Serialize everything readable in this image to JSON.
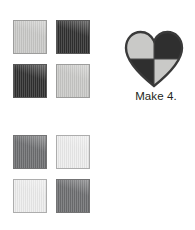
{
  "page": {
    "background": "#ffffff",
    "text_color": "#231f20"
  },
  "palette": {
    "light_gray": "#c9c9c7",
    "charcoal": "#2f2f2f",
    "slate_gray": "#6d6e70",
    "off_white": "#ededed",
    "outline": "#3a3a3a",
    "swatch_border": "#8a8a8a"
  },
  "rows": [
    {
      "id": "row-top",
      "swatches": [
        {
          "position": "top-left",
          "color": "#c9c9c7",
          "tone": "light-gray"
        },
        {
          "position": "top-right",
          "color": "#2f2f2f",
          "tone": "charcoal"
        },
        {
          "position": "bottom-left",
          "color": "#2f2f2f",
          "tone": "charcoal"
        },
        {
          "position": "bottom-right",
          "color": "#c9c9c7",
          "tone": "light-gray"
        }
      ],
      "heart": {
        "icon": "heart-block-icon",
        "rotation_deg": 0,
        "outline": "#3a3a3a",
        "quadrants": [
          {
            "position": "top-left",
            "color": "#c9c9c7"
          },
          {
            "position": "top-right",
            "color": "#2f2f2f"
          },
          {
            "position": "bottom-left",
            "color": "#2f2f2f"
          },
          {
            "position": "bottom-right",
            "color": "#c9c9c7"
          }
        ]
      },
      "caption": "Make 4."
    },
    {
      "id": "row-bottom",
      "swatches": [
        {
          "position": "top-left",
          "color": "#6d6e70",
          "tone": "slate-gray"
        },
        {
          "position": "top-right",
          "color": "#ededed",
          "tone": "off-white"
        },
        {
          "position": "bottom-left",
          "color": "#ededed",
          "tone": "off-white"
        },
        {
          "position": "bottom-right",
          "color": "#6d6e70",
          "tone": "slate-gray"
        }
      ],
      "heart": {
        "icon": "heart-block-icon",
        "rotation_deg": -45,
        "outline": "#3a3a3a",
        "quadrants": [
          {
            "position": "top-left",
            "color": "#6d6e70"
          },
          {
            "position": "top-right",
            "color": "#ededed"
          },
          {
            "position": "bottom-left",
            "color": "#ededed"
          },
          {
            "position": "bottom-right",
            "color": "#6d6e70"
          }
        ]
      },
      "caption": "Make 4."
    }
  ]
}
